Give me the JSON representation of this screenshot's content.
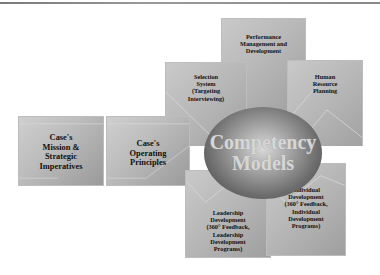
{
  "diagram": {
    "title": "",
    "center": {
      "label": "Competency\nModels"
    },
    "nodes": [
      {
        "id": "mission",
        "label": "Case's\nMission &\nStrategic\nImperatives"
      },
      {
        "id": "operating",
        "label": "Case's\nOperating\nPrinciples"
      },
      {
        "id": "selection",
        "label": "Selection\nSystem\n(Targeting\nInterviewing)"
      },
      {
        "id": "performance",
        "label": "Performance\nManagement and\nDevelopment"
      },
      {
        "id": "hr_planning",
        "label": "Human\nResource\nPlanning"
      },
      {
        "id": "leadership",
        "label": "Leadership\nDevelopment\n(360° Feedback,\nLeadership\nDevelopment\nPrograms)"
      },
      {
        "id": "individual",
        "label": "Individual\nDevelopment\n(360° Feedback,\nIndividual\nDevelopment\nPrograms)"
      }
    ],
    "flow": [
      "mission",
      "operating",
      "center"
    ],
    "colors": {
      "box": "#b8b8b8",
      "sphere_dark": "#3e3e3e",
      "sphere_light": "#d9d9d9",
      "text": "#111111",
      "line": "#808080"
    }
  }
}
